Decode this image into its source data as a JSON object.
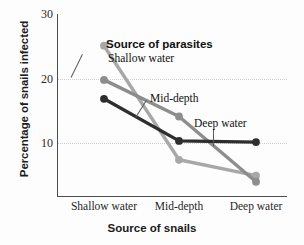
{
  "chart_data": {
    "type": "line",
    "title": "",
    "xlabel": "Source of snails",
    "ylabel": "Percentage of snails infected",
    "categories": [
      "Shallow water",
      "Mid-depth",
      "Deep water"
    ],
    "ylim": [
      0,
      30
    ],
    "yticks": [
      10,
      20,
      30
    ],
    "ytick_labels": [
      "10",
      "20",
      "30"
    ],
    "grid": "horizontal-dotted",
    "legend": "inline-annotations",
    "legend_title": "Source of parasites",
    "series": [
      {
        "name": "Shallow water",
        "color": "#a8a8a8",
        "values": [
          24.8,
          6.1,
          3.5
        ]
      },
      {
        "name": "Mid-depth",
        "color": "#8d8d8d",
        "values": [
          19.2,
          13.2,
          2.5
        ]
      },
      {
        "name": "Deep water",
        "color": "#2e2e2e",
        "values": [
          16.1,
          9.2,
          9.0
        ]
      }
    ],
    "annotations": [
      {
        "text": "Source of parasites",
        "kind": "legend-heading"
      },
      {
        "text": "Shallow water",
        "kind": "series-label"
      },
      {
        "text": "Mid-depth",
        "kind": "series-label"
      },
      {
        "text": "Deep water",
        "kind": "series-label"
      }
    ]
  },
  "axis": {
    "y_title": "Percentage of snails infected",
    "x_title": "Source of snails",
    "y_tick_30": "30",
    "y_tick_20": "20",
    "y_tick_10": "10",
    "x_tick_1": "Shallow water",
    "x_tick_2": "Mid-depth",
    "x_tick_3": "Deep water"
  },
  "annotations": {
    "legend_heading": "Source of parasites",
    "shallow_label": "Shallow water",
    "mid_label": "Mid-depth",
    "deep_label": "Deep water"
  },
  "colors": {
    "shallow": "#a8a8a8",
    "mid": "#8d8d8d",
    "deep": "#2e2e2e",
    "axis": "#4c4c4c",
    "grid": "#cfcfcf",
    "background": "#fdfdfd"
  }
}
